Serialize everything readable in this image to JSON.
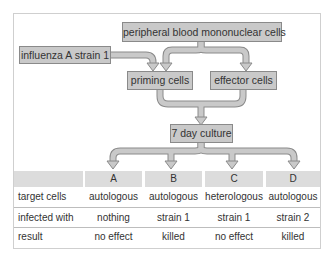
{
  "diagram": {
    "nodes": {
      "pbmc": "peripheral blood mononuclear cells",
      "influenza": "influenza A strain 1",
      "priming": "priming cells",
      "effector": "effector cells",
      "culture": "7 day culture"
    },
    "edges": [
      {
        "from": "pbmc",
        "to": "priming"
      },
      {
        "from": "pbmc",
        "to": "effector"
      },
      {
        "from": "influenza",
        "to": "priming"
      },
      {
        "from": "priming",
        "to": "culture"
      },
      {
        "from": "effector",
        "to": "culture"
      },
      {
        "from": "culture",
        "to": "A"
      },
      {
        "from": "culture",
        "to": "B"
      },
      {
        "from": "culture",
        "to": "C"
      },
      {
        "from": "culture",
        "to": "D"
      }
    ],
    "colors": {
      "box_fill": "#c9c9c9",
      "box_border": "#8a8a8a",
      "arrow_fill": "#c9c9c9",
      "header_fill": "#dcdcdc"
    }
  },
  "table": {
    "columns": [
      "A",
      "B",
      "C",
      "D"
    ],
    "rows": [
      {
        "label": "target cells",
        "values": [
          "autologous",
          "autologous",
          "heterologous",
          "autologous"
        ]
      },
      {
        "label": "infected with",
        "values": [
          "nothing",
          "strain 1",
          "strain 1",
          "strain 2"
        ]
      },
      {
        "label": "result",
        "values": [
          "no effect",
          "killed",
          "no effect",
          "killed"
        ]
      }
    ]
  }
}
